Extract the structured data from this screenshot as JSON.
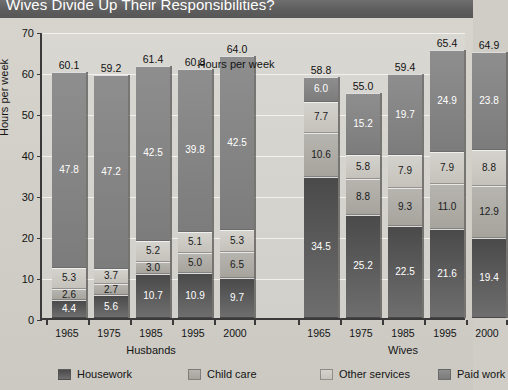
{
  "title": "Wives Divide Up Their Responsibilities?",
  "chart_data": {
    "type": "bar",
    "subtype": "stacked-bar",
    "title": "Wives Divide Up Their Responsibilities?",
    "xlabel": "Hours per week",
    "ylabel": "Hours per week",
    "ylim": [
      0,
      70
    ],
    "yticks": [
      0,
      10,
      20,
      30,
      40,
      50,
      60,
      70
    ],
    "grid": true,
    "legend_position": "bottom",
    "categories": [
      "1965",
      "1975",
      "1985",
      "1995",
      "2000"
    ],
    "groups": [
      {
        "name": "Husbands",
        "categories": [
          "1965",
          "1975",
          "1985",
          "1995",
          "2000"
        ],
        "totals": [
          "60.1",
          "59.2",
          "61.4",
          "60.8",
          "64.0"
        ],
        "series": [
          {
            "name": "Housework",
            "key": "house",
            "values": [
              "4.4",
              "5.6",
              "10.7",
              "10.9",
              "9.7"
            ]
          },
          {
            "name": "Child care",
            "key": "child",
            "values": [
              "2.6",
              "2.7",
              "3.0",
              "5.0",
              "6.5"
            ]
          },
          {
            "name": "Other services",
            "key": "other",
            "values": [
              "5.3",
              "3.7",
              "5.2",
              "5.1",
              "5.3"
            ]
          },
          {
            "name": "Paid work",
            "key": "paid",
            "values": [
              "47.8",
              "47.2",
              "42.5",
              "39.8",
              "42.5"
            ]
          }
        ]
      },
      {
        "name": "Wives",
        "categories": [
          "1965",
          "1975",
          "1985",
          "1995",
          "2000"
        ],
        "totals": [
          "58.8",
          "55.0",
          "59.4",
          "65.4",
          "64.9"
        ],
        "series": [
          {
            "name": "Housework",
            "key": "house",
            "values": [
              "34.5",
              "25.2",
              "22.5",
              "21.6",
              "19.4"
            ]
          },
          {
            "name": "Child care",
            "key": "child",
            "values": [
              "10.6",
              "8.8",
              "9.3",
              "11.0",
              "12.9"
            ]
          },
          {
            "name": "Other services",
            "key": "other",
            "values": [
              "7.7",
              "5.8",
              "7.9",
              "7.9",
              "8.8"
            ]
          },
          {
            "name": "Paid work",
            "key": "paid",
            "values": [
              "6.0",
              "15.2",
              "19.7",
              "24.9",
              "23.8"
            ]
          }
        ]
      }
    ],
    "legend": [
      {
        "label": "Housework",
        "key": "house",
        "color": "#4a4a4a"
      },
      {
        "label": "Child care",
        "key": "child",
        "color": "#a6a49d"
      },
      {
        "label": "Other services",
        "key": "other",
        "color": "#d4d2cc"
      },
      {
        "label": "Paid work",
        "key": "paid",
        "color": "#8e8e8e"
      }
    ]
  }
}
